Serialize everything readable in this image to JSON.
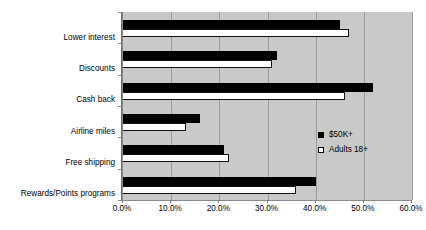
{
  "chart_data": {
    "type": "bar",
    "orientation": "horizontal",
    "title": "",
    "xlabel": "",
    "ylabel": "",
    "categories": [
      "Lower interest",
      "Discounts",
      "Cash back",
      "Airline miles",
      "Free shipping",
      "Rewards/Points programs"
    ],
    "series": [
      {
        "name": "$50K+",
        "color": "#000000",
        "values": [
          45.0,
          32.0,
          52.0,
          16.0,
          21.0,
          40.0
        ]
      },
      {
        "name": "Adults 18+",
        "color": "#ffffff",
        "values": [
          47.0,
          31.0,
          46.0,
          13.0,
          22.0,
          36.0
        ]
      }
    ],
    "xlim": [
      0,
      60
    ],
    "xticks": [
      0,
      10,
      20,
      30,
      40,
      50,
      60
    ],
    "xtick_labels": [
      "0.0%",
      "10.0%",
      "20.0%",
      "30.0%",
      "40.0%",
      "50.0%",
      "60.0%"
    ],
    "grid": true,
    "grid_axis": "x",
    "legend_position": "center-right",
    "plot_background": "#c9c9c9",
    "figure_background": "#ffffff"
  },
  "legend": {
    "entries": [
      {
        "label": "$50K+"
      },
      {
        "label": "Adults 18+"
      }
    ]
  }
}
